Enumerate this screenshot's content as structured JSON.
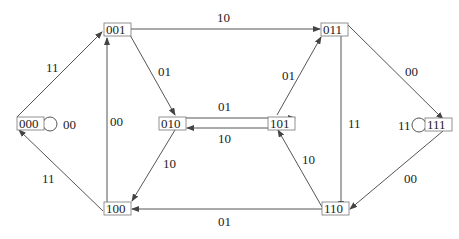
{
  "diagram": {
    "type": "state-transition",
    "nodes": [
      {
        "id": "000",
        "label": "000"
      },
      {
        "id": "001",
        "label": "001"
      },
      {
        "id": "010",
        "label": "010"
      },
      {
        "id": "011",
        "label": "011"
      },
      {
        "id": "100",
        "label": "100"
      },
      {
        "id": "101",
        "label": "101"
      },
      {
        "id": "110",
        "label": "110"
      },
      {
        "id": "111",
        "label": "111"
      }
    ],
    "edges": [
      {
        "from": "000",
        "to": "000",
        "label": "00"
      },
      {
        "from": "000",
        "to": "001",
        "label": "11"
      },
      {
        "from": "001",
        "to": "011",
        "label": "10"
      },
      {
        "from": "001",
        "to": "010",
        "label": "01"
      },
      {
        "from": "100",
        "to": "001",
        "label": "00"
      },
      {
        "from": "100",
        "to": "000",
        "label": "11"
      },
      {
        "from": "010",
        "to": "101",
        "label": "01"
      },
      {
        "from": "101",
        "to": "010",
        "label": "10"
      },
      {
        "from": "010",
        "to": "100",
        "label": "10"
      },
      {
        "from": "101",
        "to": "011",
        "label": "01"
      },
      {
        "from": "011",
        "to": "111",
        "label": "00"
      },
      {
        "from": "011",
        "to": "110",
        "label": "11"
      },
      {
        "from": "110",
        "to": "101",
        "label": "10"
      },
      {
        "from": "111",
        "to": "111",
        "label": "11"
      },
      {
        "from": "111",
        "to": "110",
        "label": "00"
      },
      {
        "from": "110",
        "to": "100",
        "label": "01"
      }
    ]
  }
}
